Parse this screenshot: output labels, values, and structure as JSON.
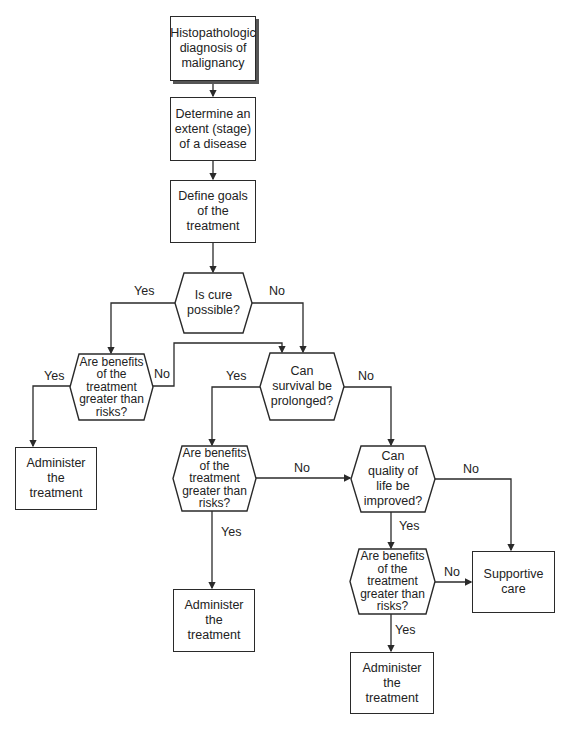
{
  "nodes": {
    "diagnosis": "Histopathologic diagnosis of malignancy",
    "stage": "Determine an extent (stage) of a disease",
    "goals": "Define goals of the treatment",
    "cure": "Is cure possible?",
    "benefits1": "Are benefits of the treatment greater than risks?",
    "survival": "Can survival be prolonged?",
    "administer1": "Administer the treatment",
    "benefits2": "Are benefits of the treatment greater than risks?",
    "quality": "Can quality of life be improved?",
    "administer2": "Administer the treatment",
    "benefits3": "Are benefits of the treatment greater than risks?",
    "supportive": "Supportive care",
    "administer3": "Administer the treatment"
  },
  "labels": {
    "cure_yes": "Yes",
    "cure_no": "No",
    "benefits1_yes": "Yes",
    "benefits1_no": "No",
    "survival_yes": "Yes",
    "survival_no": "No",
    "benefits2_no": "No",
    "benefits2_yes": "Yes",
    "quality_no": "No",
    "quality_yes": "Yes",
    "benefits3_no": "No",
    "benefits3_yes": "Yes"
  },
  "colors": {
    "stroke": "#2a2a2a",
    "text": "#222222",
    "background": "#ffffff"
  }
}
